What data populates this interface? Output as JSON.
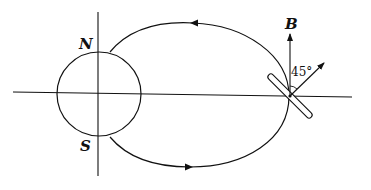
{
  "figure": {
    "labels": {
      "north": "N",
      "south": "S",
      "field": "B",
      "angle": "45°"
    },
    "colors": {
      "stroke": "#111111",
      "background": "#ffffff"
    },
    "elements": {
      "earth_circle": {
        "cx": 99,
        "cy": 94,
        "r": 42
      },
      "horizontal_axis": {
        "x1": 13,
        "y1": 92,
        "x2": 352,
        "y2": 97
      },
      "vertical_axis": {
        "x1": 98,
        "y1": 12,
        "x2": 98,
        "y2": 176
      },
      "field_line_loop": {
        "direction_top": "leftward",
        "direction_bottom": "rightward"
      },
      "rod": {
        "x1": 270,
        "y1": 75,
        "x2": 310,
        "y2": 117,
        "angle_deg": 45
      },
      "b_vector": {
        "from": [
          290,
          96
        ],
        "to": [
          290,
          33
        ]
      },
      "velocity_vector": {
        "from": [
          290,
          96
        ],
        "to": [
          324,
          63
        ],
        "angle_from_b_deg": 45
      }
    }
  }
}
